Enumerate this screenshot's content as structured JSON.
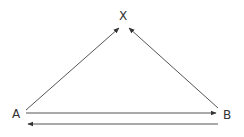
{
  "diagram": {
    "nodes": {
      "x": {
        "label": "X"
      },
      "a": {
        "label": "A"
      },
      "b": {
        "label": "B"
      }
    },
    "edges": [
      {
        "from": "A",
        "to": "X"
      },
      {
        "from": "B",
        "to": "X"
      },
      {
        "from": "A",
        "to": "B"
      },
      {
        "from": "B",
        "to": "A"
      }
    ],
    "line_color": "#444444"
  }
}
